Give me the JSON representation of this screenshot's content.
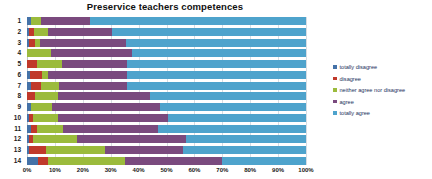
{
  "chart_data": {
    "type": "bar",
    "subtype": "100% stacked horizontal bar",
    "title": "Preservice teachers competences",
    "xlabel": "",
    "ylabel": "",
    "xlim": [
      0,
      100
    ],
    "xtick_labels": [
      "0%",
      "10%",
      "20%",
      "30%",
      "40%",
      "50%",
      "60%",
      "70%",
      "80%",
      "90%",
      "100%"
    ],
    "xtick_values": [
      0,
      10,
      20,
      30,
      40,
      50,
      60,
      70,
      80,
      90,
      100
    ],
    "grid": true,
    "legend_position": "right",
    "categories": [
      "1",
      "2",
      "3",
      "4",
      "5",
      "6",
      "7",
      "8",
      "9",
      "10",
      "11",
      "12",
      "13",
      "14"
    ],
    "series": [
      {
        "name": "totally disagree",
        "color": "#4472a8",
        "values": [
          1.5,
          0.8,
          0.8,
          0.0,
          0.0,
          1.0,
          1.5,
          0.0,
          1.5,
          0.8,
          1.5,
          0.8,
          0.8,
          4.0
        ]
      },
      {
        "name": "disagree",
        "color": "#c0392b",
        "values": [
          0.0,
          1.8,
          2.2,
          0.0,
          3.5,
          4.5,
          3.5,
          3.0,
          0.0,
          1.2,
          2.0,
          1.2,
          6.0,
          3.5
        ]
      },
      {
        "name": "neither agree nor disagree",
        "color": "#9bbb3c",
        "values": [
          3.5,
          5.0,
          1.5,
          8.5,
          9.0,
          2.0,
          6.5,
          8.0,
          7.5,
          9.0,
          9.5,
          16.0,
          21.0,
          27.5
        ]
      },
      {
        "name": "agree",
        "color": "#7a4a7e",
        "values": [
          17.5,
          23.0,
          31.0,
          29.0,
          23.5,
          28.5,
          24.5,
          33.0,
          38.5,
          39.5,
          34.0,
          39.0,
          28.0,
          35.0
        ]
      },
      {
        "name": "totally agree",
        "color": "#4ea3cc",
        "values": [
          77.5,
          69.4,
          64.5,
          62.5,
          64.0,
          64.0,
          64.0,
          56.0,
          52.5,
          49.5,
          53.0,
          43.0,
          44.2,
          30.0
        ]
      }
    ]
  },
  "legend": {
    "items": [
      {
        "label": "totally disagree"
      },
      {
        "label": "disagree"
      },
      {
        "label": "neither agree nor disagree"
      },
      {
        "label": "agree"
      },
      {
        "label": "totally agree"
      }
    ]
  }
}
